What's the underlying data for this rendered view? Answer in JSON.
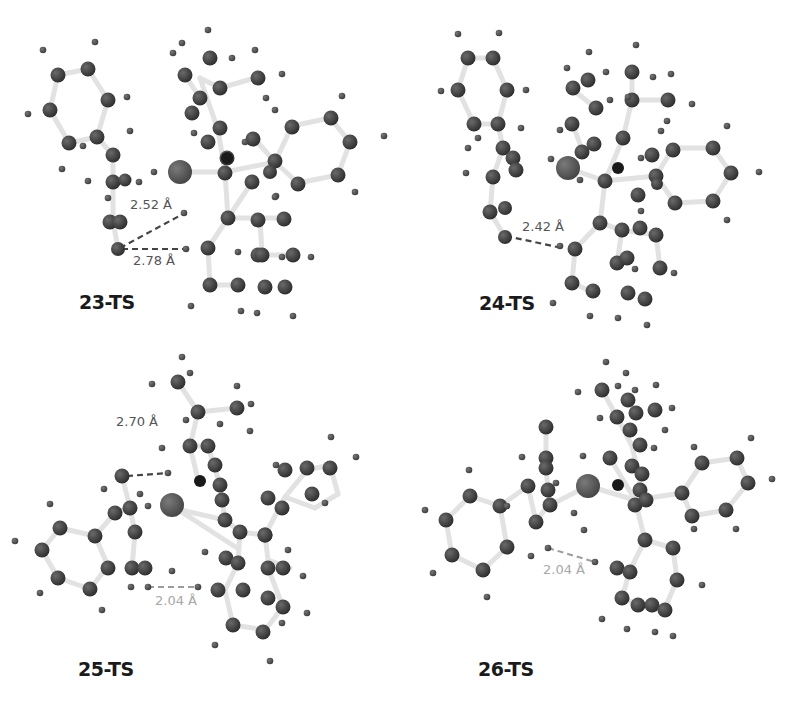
{
  "figure": {
    "panels": [
      {
        "id": "23-TS",
        "label": "23-TS",
        "distances": [
          {
            "value": "2.52 Å",
            "style": "dark"
          },
          {
            "value": "2.78 Å",
            "style": "dark"
          }
        ]
      },
      {
        "id": "24-TS",
        "label": "24-TS",
        "distances": [
          {
            "value": "2.42 Å",
            "style": "dark"
          }
        ]
      },
      {
        "id": "25-TS",
        "label": "25-TS",
        "distances": [
          {
            "value": "2.70 Å",
            "style": "dark"
          },
          {
            "value": "2.04 Å",
            "style": "light"
          }
        ]
      },
      {
        "id": "26-TS",
        "label": "26-TS",
        "distances": [
          {
            "value": "2.04 Å",
            "style": "light"
          }
        ]
      }
    ]
  },
  "colors": {
    "heavy_atom": "#3a3a3a",
    "metal_atom": "#555555",
    "hydrogen": "#4a4a4a",
    "bond": "#dedede",
    "dashed_bond_dark": "#444444",
    "dashed_bond_light": "#9a9a9a",
    "label": "#1b1b1b"
  }
}
